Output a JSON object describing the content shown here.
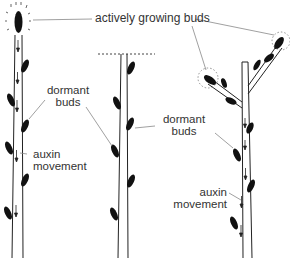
{
  "diagram": {
    "type": "botanical-illustration",
    "labels": {
      "actively_growing_buds": "actively growing buds",
      "dormant_buds_1_line1": "dormant",
      "dormant_buds_1_line2": "buds",
      "dormant_buds_2_line1": "dormant",
      "dormant_buds_2_line2": "buds",
      "auxin_movement_1_line1": "auxin",
      "auxin_movement_1_line2": "movement",
      "auxin_movement_2_line1": "auxin",
      "auxin_movement_2_line2": "movement"
    },
    "stems": [
      {
        "name": "intact-shoot",
        "apex": "actively growing terminal bud"
      },
      {
        "name": "decapitated-shoot",
        "apex": "cut (dashed line)"
      },
      {
        "name": "branched-shoot",
        "apex": "cut main stem; lateral branches actively growing"
      }
    ],
    "colors": {
      "ink": "#111111",
      "leader": "#888888",
      "text": "#333333"
    }
  }
}
